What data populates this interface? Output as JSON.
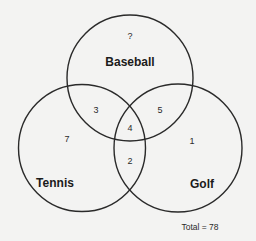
{
  "diagram": {
    "type": "venn",
    "sets": [
      {
        "name": "Baseball",
        "cx": 130,
        "cy": 78,
        "r": 63
      },
      {
        "name": "Tennis",
        "cx": 82,
        "cy": 148,
        "r": 63.5
      },
      {
        "name": "Golf",
        "cx": 178,
        "cy": 148,
        "r": 64
      }
    ],
    "labels": {
      "baseball": "Baseball",
      "tennis": "Tennis",
      "golf": "Golf"
    },
    "regions": {
      "baseball_only": "?",
      "tennis_only": "7",
      "golf_only": "1",
      "baseball_tennis": "3",
      "baseball_golf": "5",
      "tennis_golf": "2",
      "all_three": "4"
    },
    "total": "Total = 78"
  }
}
